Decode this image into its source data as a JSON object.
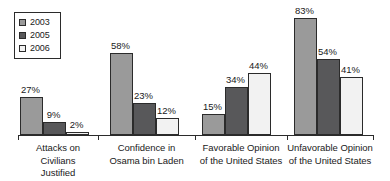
{
  "chart_data": {
    "type": "bar",
    "title": "",
    "subtitle": "",
    "xlabel": "",
    "ylabel": "",
    "ylim": [
      0,
      100
    ],
    "grid": false,
    "legend_position": "top-left",
    "value_suffix": "%",
    "categories": [
      "Attacks on Civilians Justified",
      "Confidence in Osama bin Laden",
      "Favorable Opinion of the United States",
      "Unfavorable Opinion of the United States"
    ],
    "category_lines": [
      [
        "Attacks on Civilians",
        "Justified"
      ],
      [
        "Confidence in",
        "Osama bin Laden"
      ],
      [
        "Favorable Opinion",
        "of the United States"
      ],
      [
        "Unfavorable Opinion",
        "of the United States"
      ]
    ],
    "series": [
      {
        "name": "2003",
        "color": "#9a9a9a",
        "values": [
          27,
          58,
          15,
          83
        ],
        "labels": [
          "27%",
          "58%",
          "15%",
          "83%"
        ]
      },
      {
        "name": "2005",
        "color": "#58585a",
        "values": [
          9,
          23,
          34,
          54
        ],
        "labels": [
          "9%",
          "23%",
          "34%",
          "54%"
        ]
      },
      {
        "name": "2006",
        "color": "#f2f2f2",
        "values": [
          2,
          12,
          44,
          41
        ],
        "labels": [
          "2%",
          "12%",
          "44%",
          "41%"
        ]
      }
    ]
  },
  "legend": {
    "items": [
      {
        "label": "2003",
        "color": "#9a9a9a"
      },
      {
        "label": "2005",
        "color": "#58585a"
      },
      {
        "label": "2006",
        "color": "#f2f2f2"
      }
    ]
  },
  "axis": {
    "line_color": "#2b2b2b"
  }
}
